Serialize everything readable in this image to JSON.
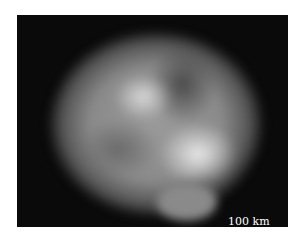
{
  "image": {
    "subject": "asteroid",
    "background_color": "#0a0a0a"
  },
  "scale_bar": {
    "label": "100 km"
  }
}
